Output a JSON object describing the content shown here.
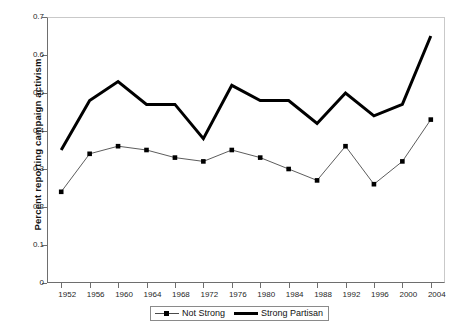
{
  "chart_data": {
    "type": "line",
    "title": "",
    "xlabel": "",
    "ylabel": "Percent reporting campaign activism",
    "x": [
      1952,
      1956,
      1960,
      1964,
      1968,
      1972,
      1976,
      1980,
      1984,
      1988,
      1992,
      1996,
      2000,
      2004
    ],
    "xticklabels": [
      "1952",
      "1956",
      "1960",
      "1964",
      "1968",
      "1972",
      "1976",
      "1980",
      "1984",
      "1988",
      "1992",
      "1996",
      "2000",
      "2004"
    ],
    "yticklabels": [
      "0",
      "0.1",
      "0.2",
      "0.3",
      "0.4",
      "0.5",
      "0.6",
      "0.7"
    ],
    "ytickvalues": [
      0,
      0.1,
      0.2,
      0.3,
      0.4,
      0.5,
      0.6,
      0.7
    ],
    "ylim": [
      0,
      0.7
    ],
    "xlim": [
      1950,
      2006
    ],
    "grid": false,
    "legend_position": "bottom-center",
    "series": [
      {
        "name": "Not Strong",
        "style": "thin-line-with-square-markers",
        "color": "#000000",
        "line_color": "#4a4a4a",
        "values": [
          0.24,
          0.34,
          0.36,
          0.35,
          0.33,
          0.32,
          0.35,
          0.33,
          0.3,
          0.27,
          0.36,
          0.26,
          0.32,
          0.43
        ]
      },
      {
        "name": "Strong Partisan",
        "style": "thick-line",
        "color": "#000000",
        "line_color": "#000000",
        "values": [
          0.35,
          0.48,
          0.53,
          0.47,
          0.47,
          0.38,
          0.52,
          0.48,
          0.48,
          0.42,
          0.5,
          0.44,
          0.47,
          0.65
        ]
      }
    ]
  },
  "legend": {
    "entries": [
      {
        "label": "Not Strong"
      },
      {
        "label": "Strong Partisan"
      }
    ]
  }
}
